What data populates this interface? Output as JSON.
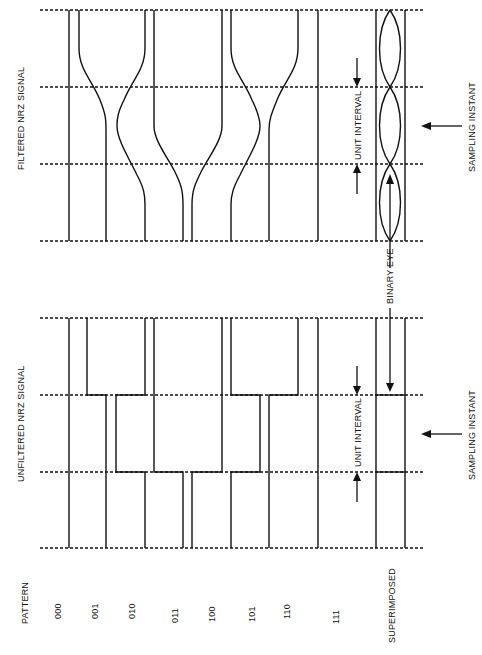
{
  "labels": {
    "filtered_title": "FILTERED NRZ SIGNAL",
    "unfiltered_title": "UNFILTERED NRZ SIGNAL",
    "unit_interval_top": "UNIT INTERVAL",
    "unit_interval_bottom": "UNIT INTERVAL",
    "sampling_instant_top": "SAMPLING INSTANT",
    "sampling_instant_bottom": "SAMPLING INSTANT",
    "binary_eye": "BINARY EYE",
    "pattern_header": "PATTERN",
    "superimposed": "SUPERIMPOSED"
  },
  "patterns": [
    "000",
    "001",
    "010",
    "011",
    "100",
    "101",
    "110",
    "111"
  ],
  "colors": {
    "ink": "#111111",
    "background": "#ffffff"
  }
}
